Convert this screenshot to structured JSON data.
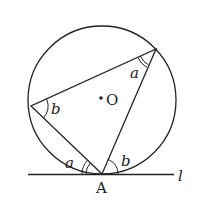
{
  "diagram": {
    "type": "geometry",
    "circle": {
      "center_label": "O",
      "cx": 102,
      "cy": 100,
      "r": 74
    },
    "points": {
      "A": {
        "label": "A",
        "x": 102,
        "y": 174
      },
      "left": {
        "x": 31,
        "y": 106
      },
      "top_right": {
        "x": 156,
        "y": 49
      }
    },
    "tangent_line": {
      "label": "l",
      "x1": 28,
      "x2": 174,
      "y": 174
    },
    "angle_labels": {
      "top_right": "a",
      "left": "b",
      "A_left": "a",
      "A_right": "b"
    },
    "colors": {
      "stroke": "#222222",
      "background": "#ffffff"
    }
  }
}
